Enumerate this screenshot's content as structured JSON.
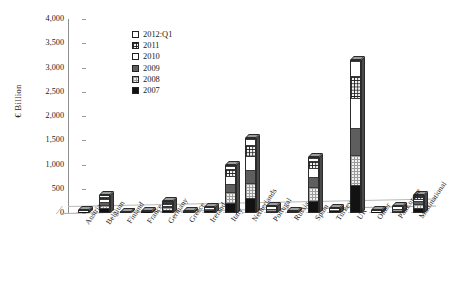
{
  "chart_data": {
    "type": "bar",
    "subtype": "stacked-bar-3d",
    "title": "",
    "xlabel": "",
    "ylabel": "€ Billion",
    "ylim": [
      0,
      4000
    ],
    "yticks": [
      "0",
      "500",
      "1,000",
      "1,500",
      "2,000",
      "2,500",
      "3,000",
      "3,500",
      "4,000"
    ],
    "ytick_values": [
      0,
      500,
      1000,
      1500,
      2000,
      2500,
      3000,
      3500,
      4000
    ],
    "grid": false,
    "legend_position": "upper-left-inside",
    "stack_order_bottom_to_top": [
      "2007",
      "2008",
      "2009",
      "2010",
      "2011",
      "2012:Q1"
    ],
    "categories": [
      "Austria",
      "Belgium",
      "Finland",
      "France",
      "Germany",
      "Greece",
      "Ireland",
      "Italy",
      "Netherlands",
      "Portugal",
      "Russia",
      "Spain",
      "Turkey",
      "UK",
      "Other",
      "PanEurope",
      "Multinational"
    ],
    "series": [
      {
        "name": "2007",
        "pattern": "solid-black",
        "color": "#121212",
        "values": [
          10,
          95,
          5,
          12,
          60,
          8,
          25,
          200,
          290,
          30,
          8,
          240,
          20,
          560,
          10,
          35,
          95
        ]
      },
      {
        "name": "2008",
        "pattern": "dotted-light-grey",
        "color": "#efefef",
        "values": [
          12,
          75,
          6,
          10,
          55,
          7,
          30,
          230,
          330,
          35,
          9,
          300,
          22,
          640,
          12,
          30,
          85
        ]
      },
      {
        "name": "2009",
        "pattern": "solid-dark-grey",
        "color": "#5e5e5e",
        "values": [
          10,
          60,
          5,
          9,
          45,
          6,
          22,
          170,
          270,
          25,
          7,
          215,
          18,
          560,
          10,
          25,
          70
        ]
      },
      {
        "name": "2010",
        "pattern": "white",
        "color": "#ffffff",
        "values": [
          9,
          65,
          5,
          8,
          40,
          5,
          18,
          180,
          290,
          22,
          6,
          190,
          16,
          620,
          9,
          22,
          60
        ]
      },
      {
        "name": "2011",
        "pattern": "crosshatch-grid",
        "color": "#f2f2f2",
        "values": [
          8,
          50,
          4,
          7,
          35,
          4,
          14,
          150,
          230,
          18,
          5,
          145,
          14,
          460,
          8,
          18,
          50
        ]
      },
      {
        "name": "2012:Q1",
        "pattern": "white-outline",
        "color": "#ffffff",
        "values": [
          3,
          25,
          2,
          4,
          15,
          2,
          6,
          70,
          140,
          8,
          2,
          60,
          6,
          310,
          3,
          8,
          20
        ]
      }
    ],
    "totals": [
      52,
      370,
      27,
      50,
      250,
      32,
      115,
      1000,
      1550,
      138,
      37,
      1150,
      96,
      3150,
      52,
      138,
      380
    ]
  },
  "legend": {
    "entries": [
      {
        "label": "2012:Q1",
        "pattern": "p-2012"
      },
      {
        "label": "2011",
        "pattern": "p-2011"
      },
      {
        "label": "2010",
        "pattern": "p-2010"
      },
      {
        "label": "2009",
        "pattern": "p-2009"
      },
      {
        "label": "2008",
        "pattern": "p-2008"
      },
      {
        "label": "2007",
        "pattern": "p-2007"
      }
    ]
  }
}
